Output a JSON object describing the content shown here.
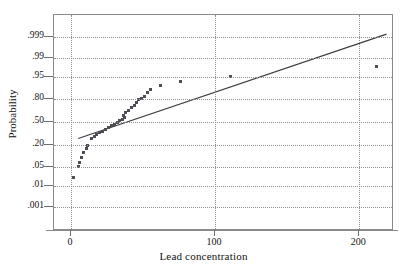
{
  "chart_data": {
    "type": "scatter",
    "title": "",
    "xlabel": "Lead concentration",
    "ylabel": "Probability",
    "xlim": [
      -11.8,
      224.2
    ],
    "ylim_probability": [
      0.0002,
      0.9995
    ],
    "grid": true,
    "legend": null,
    "xticks": [
      0,
      100,
      200
    ],
    "xticklabels": [
      "0",
      "100",
      "200"
    ],
    "yticks": [
      0.001,
      0.01,
      0.05,
      0.2,
      0.5,
      0.8,
      0.95,
      0.99,
      0.999
    ],
    "yticklabels": [
      ".001",
      ".01",
      ".05",
      ".20",
      ".50",
      ".80",
      ".95",
      ".99",
      ".999"
    ],
    "yscale": "normal-probability",
    "series": [
      {
        "name": "Lead concentration sample quantiles",
        "marker": "square",
        "color": "#4d4d55",
        "points": [
          {
            "x": 2.0,
            "p": 0.022
          },
          {
            "x": 5.0,
            "p": 0.052
          },
          {
            "x": 6.0,
            "p": 0.072
          },
          {
            "x": 7.5,
            "p": 0.1
          },
          {
            "x": 9.0,
            "p": 0.13
          },
          {
            "x": 10.5,
            "p": 0.165
          },
          {
            "x": 11.5,
            "p": 0.2
          },
          {
            "x": 14.0,
            "p": 0.27
          },
          {
            "x": 16.0,
            "p": 0.3
          },
          {
            "x": 17.5,
            "p": 0.32
          },
          {
            "x": 20.0,
            "p": 0.345
          },
          {
            "x": 22.0,
            "p": 0.37
          },
          {
            "x": 24.0,
            "p": 0.395
          },
          {
            "x": 26.0,
            "p": 0.42
          },
          {
            "x": 28.0,
            "p": 0.445
          },
          {
            "x": 30.0,
            "p": 0.468
          },
          {
            "x": 32.0,
            "p": 0.49
          },
          {
            "x": 34.0,
            "p": 0.515
          },
          {
            "x": 35.5,
            "p": 0.54
          },
          {
            "x": 37.0,
            "p": 0.57
          },
          {
            "x": 36.5,
            "p": 0.6
          },
          {
            "x": 38.0,
            "p": 0.64
          },
          {
            "x": 40.0,
            "p": 0.665
          },
          {
            "x": 42.0,
            "p": 0.7
          },
          {
            "x": 44.0,
            "p": 0.73
          },
          {
            "x": 45.5,
            "p": 0.76
          },
          {
            "x": 47.0,
            "p": 0.79
          },
          {
            "x": 49.0,
            "p": 0.805
          },
          {
            "x": 51.0,
            "p": 0.82
          },
          {
            "x": 53.0,
            "p": 0.855
          },
          {
            "x": 55.0,
            "p": 0.88
          },
          {
            "x": 62.0,
            "p": 0.905
          },
          {
            "x": 76.0,
            "p": 0.93
          },
          {
            "x": 111.0,
            "p": 0.952
          },
          {
            "x": 212.0,
            "p": 0.978
          }
        ]
      }
    ],
    "reference_line": {
      "name": "normal fit line",
      "color": "#3a3a42",
      "x_start": 5.0,
      "p_start": 0.275,
      "x_end": 219.0,
      "p_end": 0.9993
    }
  }
}
